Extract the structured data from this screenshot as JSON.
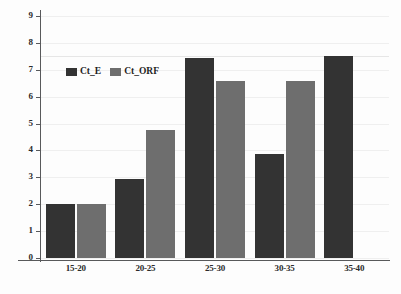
{
  "chart_data": {
    "type": "bar",
    "title": "",
    "subtitle": "",
    "xlabel": "",
    "ylabel": "",
    "categories": [
      "15-20",
      "20-25",
      "25-30",
      "30-35",
      "35-40"
    ],
    "series": [
      {
        "name": "Ct_E",
        "color": "#333333",
        "values": [
          2.0,
          2.95,
          7.45,
          3.85,
          7.5
        ]
      },
      {
        "name": "Ct_ORF",
        "color": "#6e6e6e",
        "values": [
          2.0,
          4.75,
          6.6,
          6.6,
          null
        ]
      }
    ],
    "ylim": [
      0,
      9
    ],
    "yticks": [
      0,
      1,
      2,
      3,
      4,
      5,
      6,
      7,
      8,
      9
    ],
    "ytick_labels": [
      "0",
      "1",
      "2",
      "3",
      "4",
      "5",
      "6",
      "7",
      "8",
      "9"
    ],
    "grid": true,
    "grid_axis": "y",
    "legend_position": "upper left inside plot",
    "bar_orientation": "vertical",
    "grouping": "clustered"
  },
  "legend": {
    "entries": [
      {
        "label": "Ct_E"
      },
      {
        "label": "Ct_ORF"
      }
    ]
  },
  "colors": {
    "series_dark": "#333333",
    "series_gray": "#6e6e6e",
    "axis": "#58595b",
    "gridline": "#efefef",
    "background": "#fdfdfd",
    "text": "#2b2b2b"
  }
}
